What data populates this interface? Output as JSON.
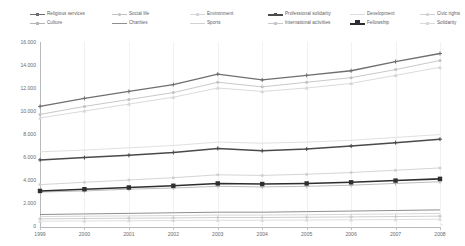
{
  "chart_data": {
    "type": "line",
    "title": "",
    "subtitle": "",
    "xlabel": "",
    "ylabel": "",
    "x": [
      1999,
      2000,
      2001,
      2002,
      2003,
      2004,
      2005,
      2006,
      2007,
      2008
    ],
    "categories": [
      "1999",
      "2000",
      "2001",
      "2002",
      "2003",
      "2004",
      "2005",
      "2006",
      "2007",
      "2008"
    ],
    "ylim": [
      0,
      16000
    ],
    "ytick_values": [
      0,
      2000,
      4000,
      6000,
      8000,
      10000,
      12000,
      14000,
      16000
    ],
    "ytick_labels": [
      "0",
      "2.000",
      "4.000",
      "6.000",
      "8.000",
      "10.000",
      "12.000",
      "14.000",
      "16.000"
    ],
    "grid": "vertical-only",
    "legend_position": "top",
    "legend_columns": 6,
    "legend_rows": 2,
    "series": [
      {
        "name": "Religious services",
        "color": "#6f6f71",
        "width": 1.3,
        "marker": "plus",
        "values": [
          10400,
          11100,
          11700,
          12300,
          13200,
          12700,
          13100,
          13500,
          14300,
          15000
        ]
      },
      {
        "name": "Social life",
        "color": "#c2c2c4",
        "width": 0.9,
        "marker": "dot",
        "values": [
          9700,
          10400,
          11000,
          11600,
          12500,
          12100,
          12500,
          12900,
          13600,
          14400
        ]
      },
      {
        "name": "Environment",
        "color": "#d6d6d8",
        "width": 0.9,
        "marker": "tri",
        "values": [
          9400,
          10000,
          10600,
          11200,
          12000,
          11700,
          12000,
          12400,
          13100,
          13800
        ]
      },
      {
        "name": "Professional solidarity",
        "color": "#4a4a4c",
        "width": 1.5,
        "marker": "plus",
        "values": [
          5750,
          5950,
          6150,
          6400,
          6750,
          6550,
          6700,
          6950,
          7250,
          7550
        ]
      },
      {
        "name": "Development",
        "color": "#dcdcde",
        "width": 0.9,
        "marker": "none",
        "values": [
          6450,
          6600,
          6800,
          7000,
          7300,
          7200,
          7300,
          7450,
          7700,
          7950
        ]
      },
      {
        "name": "Civic rights",
        "color": "#cfcfd1",
        "width": 0.9,
        "marker": "dot",
        "values": [
          3600,
          3800,
          4000,
          4200,
          4450,
          4400,
          4500,
          4650,
          4850,
          5050
        ]
      },
      {
        "name": "Culture",
        "color": "#b5b5b7",
        "width": 0.9,
        "marker": "plus",
        "values": [
          2950,
          3050,
          3200,
          3300,
          3450,
          3400,
          3450,
          3550,
          3700,
          3850
        ]
      },
      {
        "name": "Charities",
        "color": "#8e8e90",
        "width": 1.0,
        "marker": "none",
        "values": [
          1000,
          1050,
          1100,
          1150,
          1200,
          1200,
          1250,
          1300,
          1350,
          1400
        ]
      },
      {
        "name": "Sports",
        "color": "#d2d2d4",
        "width": 0.9,
        "marker": "none",
        "values": [
          820,
          850,
          880,
          910,
          950,
          950,
          980,
          1010,
          1050,
          1100
        ]
      },
      {
        "name": "International activities",
        "color": "#c8c8ca",
        "width": 0.9,
        "marker": "plus",
        "values": [
          620,
          650,
          680,
          700,
          740,
          740,
          760,
          790,
          820,
          860
        ]
      },
      {
        "name": "Fellowship",
        "color": "#2e2e30",
        "width": 1.6,
        "marker": "square",
        "values": [
          3050,
          3200,
          3350,
          3500,
          3700,
          3650,
          3700,
          3800,
          3950,
          4100
        ]
      },
      {
        "name": "Solidarity",
        "color": "#dadadc",
        "width": 0.9,
        "marker": "tri",
        "values": [
          420,
          440,
          460,
          480,
          500,
          500,
          520,
          540,
          560,
          590
        ]
      }
    ]
  }
}
